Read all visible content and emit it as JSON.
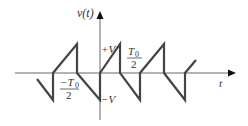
{
  "diagram": {
    "y_axis_label": "v(t)",
    "x_axis_label": "t",
    "labels": {
      "plus_v": "+V",
      "minus_v": "−V",
      "neg_half_period_num": "−T",
      "neg_half_period_sub": "0",
      "neg_half_period_den": "2",
      "half_period_num": "T",
      "half_period_sub": "0",
      "half_period_den": "2"
    },
    "colors": {
      "waveform": "#444444",
      "axes": "#666666"
    }
  }
}
